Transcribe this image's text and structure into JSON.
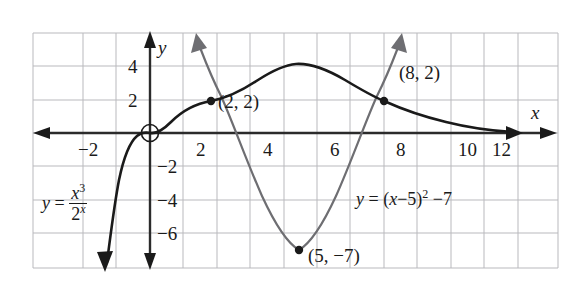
{
  "figure": {
    "background": "#ffffff",
    "grid_color": "#b9b9bd",
    "curve_colors": {
      "cubic_exponential": "#1a1a1a",
      "parabola": "#6e6e72",
      "axis": "#2b2b2b"
    }
  },
  "axes": {
    "x_axis_label": "x",
    "y_axis_label": "y",
    "x_ticks": [
      {
        "value": -2,
        "label": "−2"
      },
      {
        "value": 2,
        "label": "2"
      },
      {
        "value": 4,
        "label": "4"
      },
      {
        "value": 6,
        "label": "6"
      },
      {
        "value": 8,
        "label": "8"
      },
      {
        "value": 10,
        "label": "10"
      },
      {
        "value": 12,
        "label": "12"
      }
    ],
    "y_ticks": [
      {
        "value": 4,
        "label": "4"
      },
      {
        "value": 2,
        "label": "2"
      },
      {
        "value": -2,
        "label": "−2"
      },
      {
        "value": -4,
        "label": "−4"
      },
      {
        "value": -6,
        "label": "−6"
      }
    ],
    "xlim": [
      -4,
      14
    ],
    "ylim": [
      -8.5,
      5.5
    ],
    "grid": true
  },
  "annotations": {
    "point_2_2": "(2, 2)",
    "point_8_2": "(8, 2)",
    "vertex_5_neg7": "(5, −7)",
    "origin_marker": "circled-origin"
  },
  "equations": {
    "cubic_exponential": {
      "lhs": "y",
      "equals": "=",
      "numerator": "x",
      "numerator_exp": "3",
      "denominator": "2",
      "denominator_exp": "x"
    },
    "parabola": {
      "text_part1": "y",
      "text_part2": "=",
      "text_part3": "(x",
      "text_part4": "−",
      "text_part5": "5)",
      "text_exp": "2",
      "text_part6": "−",
      "text_part7": "7"
    }
  },
  "chart_data": {
    "type": "line",
    "title": "",
    "xlabel": "x",
    "ylabel": "y",
    "xlim": [
      -4,
      14
    ],
    "ylim": [
      -8.5,
      5.5
    ],
    "grid": true,
    "legend": "none",
    "series": [
      {
        "name": "y = x^3 / 2^x",
        "color": "#1a1a1a",
        "x": [
          -2.6,
          -2.4,
          -2.2,
          -2.0,
          -1.8,
          -1.6,
          -1.4,
          -1.2,
          -1.0,
          -0.8,
          -0.6,
          -0.4,
          -0.2,
          0.0,
          0.5,
          1.0,
          1.5,
          2.0,
          2.5,
          3.0,
          3.5,
          4.0,
          4.33,
          5.0,
          5.5,
          6.0,
          7.0,
          8.0,
          9.0,
          10.0,
          11.0,
          12.0,
          12.8
        ],
        "y": [
          -106.6,
          -72.5,
          -48.9,
          -32.0,
          -20.1,
          -12.4,
          -7.24,
          -3.97,
          -2.0,
          -0.89,
          -0.33,
          -0.08,
          -0.009,
          0.0,
          0.088,
          0.5,
          1.19,
          2.0,
          2.76,
          3.38,
          3.79,
          4.0,
          4.03,
          3.91,
          3.62,
          3.38,
          2.68,
          2.0,
          1.42,
          0.98,
          0.65,
          0.42,
          0.3
        ],
        "note": "Cubic-over-exponential curve; rises steeply from lower-left, flattens near origin with inflection, peaks near x=4.33 at y≈4, then decays toward the x-axis"
      },
      {
        "name": "y = (x - 5)^2 - 7",
        "color": "#6e6e72",
        "x": [
          1.35,
          1.5,
          2.0,
          2.5,
          3.0,
          3.5,
          4.0,
          4.5,
          5.0,
          5.5,
          6.0,
          6.5,
          7.0,
          7.5,
          8.0,
          8.5,
          8.65
        ],
        "y": [
          6.3,
          5.25,
          2.0,
          -0.75,
          -3.0,
          -4.75,
          -6.0,
          -6.75,
          -7.0,
          -6.75,
          -6.0,
          -4.75,
          -3.0,
          -0.75,
          2.0,
          5.25,
          6.3
        ],
        "note": "Upward parabola, vertex (5,-7), arrows on both arms"
      }
    ],
    "points": [
      {
        "label": "(2, 2)",
        "x": 2,
        "y": 2
      },
      {
        "label": "(8, 2)",
        "x": 8,
        "y": 2
      },
      {
        "label": "(5, −7)",
        "x": 5,
        "y": -7
      }
    ],
    "annotations": [
      {
        "text": "y = x^3/2^x",
        "x": -2.2,
        "y": -4.2
      },
      {
        "text": "y = (x-5)^2 - 7",
        "x": 7.4,
        "y": -3.6
      }
    ]
  }
}
